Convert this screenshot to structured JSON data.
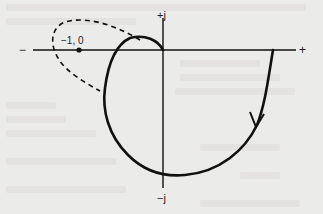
{
  "figure": {
    "type": "nyquist-plot",
    "axes": {
      "real_negative_label": "−",
      "real_positive_label": "+",
      "imag_positive_label": "+j",
      "imag_negative_label": "−j"
    },
    "critical_point": {
      "label": "−1, 0"
    },
    "curves": [
      {
        "name": "solid-locus",
        "style": "solid",
        "has_direction_arrow": true
      },
      {
        "name": "dashed-locus",
        "style": "dashed",
        "has_direction_arrow": false
      }
    ],
    "colors": {
      "background": "#ebebea",
      "ink": "#111111"
    }
  }
}
